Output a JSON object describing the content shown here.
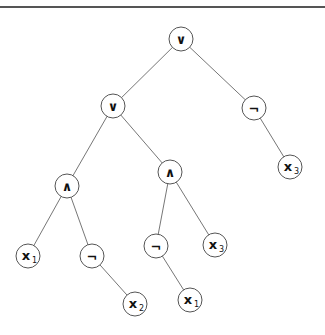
{
  "diagram": {
    "type": "expression-tree",
    "nodes": [
      {
        "id": "n0",
        "label": "∨",
        "sub": "",
        "x": 181,
        "y": 39
      },
      {
        "id": "n1",
        "label": "∨",
        "sub": "",
        "x": 113,
        "y": 106
      },
      {
        "id": "n2",
        "label": "¬",
        "sub": "",
        "x": 254,
        "y": 108
      },
      {
        "id": "n3",
        "label": "∧",
        "sub": "",
        "x": 67,
        "y": 186
      },
      {
        "id": "n4",
        "label": "∧",
        "sub": "",
        "x": 170,
        "y": 172
      },
      {
        "id": "n5",
        "label": "x",
        "sub": "3",
        "x": 290,
        "y": 167
      },
      {
        "id": "n6",
        "label": "x",
        "sub": "1",
        "x": 28,
        "y": 256
      },
      {
        "id": "n7",
        "label": "¬",
        "sub": "",
        "x": 92,
        "y": 256
      },
      {
        "id": "n8",
        "label": "¬",
        "sub": "",
        "x": 156,
        "y": 246
      },
      {
        "id": "n9",
        "label": "x",
        "sub": "3",
        "x": 215,
        "y": 245
      },
      {
        "id": "n10",
        "label": "x",
        "sub": "2",
        "x": 135,
        "y": 304
      },
      {
        "id": "n11",
        "label": "x",
        "sub": "1",
        "x": 190,
        "y": 300
      }
    ],
    "edges": [
      [
        "n0",
        "n1"
      ],
      [
        "n0",
        "n2"
      ],
      [
        "n2",
        "n5"
      ],
      [
        "n1",
        "n3"
      ],
      [
        "n1",
        "n4"
      ],
      [
        "n3",
        "n6"
      ],
      [
        "n3",
        "n7"
      ],
      [
        "n7",
        "n10"
      ],
      [
        "n4",
        "n8"
      ],
      [
        "n4",
        "n9"
      ],
      [
        "n8",
        "n11"
      ]
    ]
  }
}
